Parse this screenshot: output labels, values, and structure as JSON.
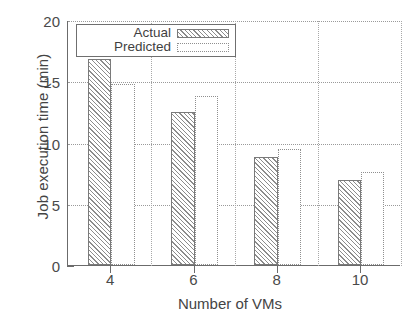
{
  "chart_data": {
    "type": "bar",
    "title": "",
    "xlabel": "Number of VMs",
    "ylabel": "Job execution time (min)",
    "categories": [
      "4",
      "6",
      "8",
      "10"
    ],
    "series": [
      {
        "name": "Actual",
        "values": [
          16.8,
          12.5,
          8.8,
          6.9
        ]
      },
      {
        "name": "Predicted",
        "values": [
          14.8,
          13.8,
          9.5,
          7.6
        ]
      }
    ],
    "ylim": [
      0,
      20
    ],
    "yticks": [
      "0",
      "5",
      "10",
      "15",
      "20"
    ],
    "xticks": [
      "4",
      "6",
      "8",
      "10"
    ],
    "grid": "horizontal-dotted",
    "legend_position": "top-left-inside"
  },
  "axes": {
    "y_title": "Job execution time (min)",
    "x_title": "Number of VMs",
    "y_tick_labels": [
      "20",
      "15",
      "10",
      "5",
      "0"
    ],
    "x_tick_labels": [
      "4",
      "6",
      "8",
      "10"
    ]
  },
  "legend": {
    "entries": [
      {
        "label": "Actual",
        "swatch": "hatched-diagonal"
      },
      {
        "label": "Predicted",
        "swatch": "dotted-outline-white"
      }
    ]
  },
  "colors": {
    "axis": "#6b6b6b",
    "grid": "#9a9a9a",
    "bar_actual_outline": "#7a7a7a",
    "bar_actual_hatch": "#8c8c8c",
    "bar_predicted_outline": "#8f8f8f",
    "background": "#ffffff",
    "text": "#444444"
  }
}
